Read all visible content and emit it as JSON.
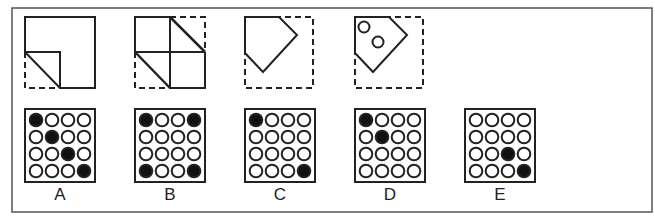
{
  "puzzle": {
    "type": "paper-folding-punch",
    "folding_steps": [
      {
        "id": "step-1",
        "description": "bottom-left corner folded up diagonally"
      },
      {
        "id": "step-2",
        "description": "top-right corner folded down diagonally"
      },
      {
        "id": "step-3",
        "description": "folded pentagon shape"
      },
      {
        "id": "step-4",
        "description": "two holes punched in folded shape"
      }
    ],
    "options": [
      {
        "label": "A",
        "filled": [
          [
            0,
            0
          ],
          [
            1,
            1
          ],
          [
            2,
            2
          ],
          [
            3,
            3
          ]
        ]
      },
      {
        "label": "B",
        "filled": [
          [
            0,
            0
          ],
          [
            0,
            3
          ],
          [
            3,
            0
          ],
          [
            3,
            3
          ]
        ]
      },
      {
        "label": "C",
        "filled": [
          [
            0,
            0
          ],
          [
            3,
            3
          ]
        ]
      },
      {
        "label": "D",
        "filled": [
          [
            0,
            0
          ],
          [
            1,
            1
          ]
        ]
      },
      {
        "label": "E",
        "filled": [
          [
            2,
            2
          ],
          [
            3,
            3
          ]
        ]
      }
    ],
    "grid_size": 4
  },
  "colors": {
    "stroke": "#222222",
    "frame": "#555555",
    "fill_hole": "#111111",
    "background": "#ffffff"
  }
}
